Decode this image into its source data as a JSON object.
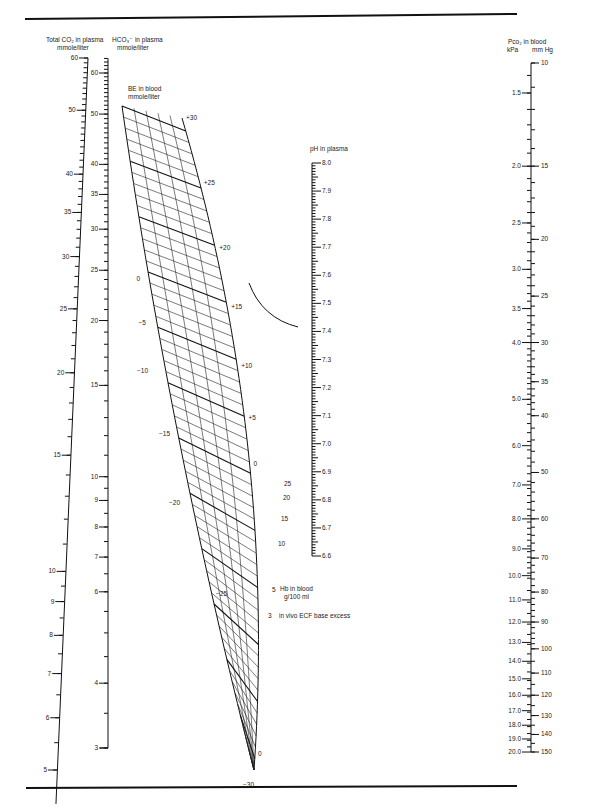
{
  "figure": {
    "type": "nomogram",
    "rules": {
      "top_y": 29,
      "bottom_y": 788
    }
  },
  "scales": {
    "total_co2": {
      "title_line1": "Total CO₂ in plasma",
      "title_line2": "mmole/liter",
      "major_labels": [
        "60",
        "50",
        "40",
        "35",
        "30",
        "25",
        "20",
        "15",
        "10",
        "9",
        "8",
        "7",
        "6",
        "5"
      ],
      "major_values": [
        60,
        50,
        40,
        35,
        30,
        25,
        20,
        15,
        10,
        9,
        8,
        7,
        6,
        5
      ],
      "range": [
        5,
        60
      ]
    },
    "hco3": {
      "title_line1": "HCO₃⁻ in plasma",
      "title_line2": "mmole/liter",
      "major_labels": [
        "60",
        "50",
        "40",
        "35",
        "30",
        "25",
        "20",
        "15",
        "10",
        "9",
        "8",
        "7",
        "6",
        "4",
        "3"
      ],
      "major_values": [
        60,
        50,
        40,
        35,
        30,
        25,
        20,
        15,
        10,
        9,
        8,
        7,
        6,
        4,
        3
      ],
      "range": [
        3,
        60
      ]
    },
    "be_blood": {
      "title_line1": "BE in blood",
      "title_line2": "mmole/liter",
      "right_labels": [
        "+30",
        "+25",
        "+20",
        "+15",
        "+10",
        "+5",
        "0"
      ],
      "left_labels": [
        "0",
        "−5",
        "−10",
        "−15",
        "−20",
        "−25",
        "−30"
      ]
    },
    "hb_blood": {
      "title_line1": "Hb in blood",
      "title_line2": "g/100 ml",
      "labels": [
        "25",
        "20",
        "15",
        "10",
        "5",
        "0"
      ]
    },
    "ecf_be": {
      "value_label": "3",
      "title": "in vivo ECF base excess"
    },
    "ph": {
      "title": "pH in plasma",
      "major_labels": [
        "8.0",
        "7.9",
        "7.8",
        "7.7",
        "7.6",
        "7.5",
        "7.4",
        "7.3",
        "7.2",
        "7.1",
        "7.0",
        "6.9",
        "6.8",
        "6.7",
        "6.6"
      ],
      "major_values": [
        8.0,
        7.9,
        7.8,
        7.7,
        7.6,
        7.5,
        7.4,
        7.3,
        7.2,
        7.1,
        7.0,
        6.9,
        6.8,
        6.7,
        6.6
      ]
    },
    "pco2": {
      "title": "Pco₂ in blood",
      "unit_kpa": "kPa",
      "unit_mmhg": "mm Hg",
      "kpa_labels": [
        "1.5",
        "2.0",
        "2.5",
        "3.0",
        "3.5",
        "4.0",
        "5.0",
        "6.0",
        "7.0",
        "8.0",
        "9.0",
        "10.0",
        "11.0",
        "12.0",
        "13.0",
        "14.0",
        "15.0",
        "16.0",
        "17.0",
        "18.0",
        "19.0",
        "20.0"
      ],
      "kpa_values": [
        1.5,
        2.0,
        2.5,
        3.0,
        3.5,
        4.0,
        5.0,
        6.0,
        7.0,
        8.0,
        9.0,
        10.0,
        11.0,
        12.0,
        13.0,
        14.0,
        15.0,
        16.0,
        17.0,
        18.0,
        19.0,
        20.0
      ],
      "mmhg_labels": [
        "10",
        "15",
        "20",
        "25",
        "30",
        "35",
        "40",
        "50",
        "60",
        "70",
        "80",
        "90",
        "100",
        "110",
        "120",
        "130",
        "140",
        "150"
      ],
      "mmhg_values": [
        10,
        15,
        20,
        25,
        30,
        35,
        40,
        50,
        60,
        70,
        80,
        90,
        100,
        110,
        120,
        130,
        140,
        150
      ]
    }
  }
}
